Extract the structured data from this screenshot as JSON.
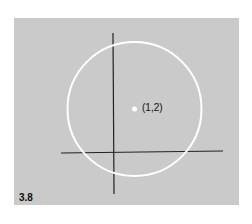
{
  "figure": {
    "label": "3.8",
    "background_color": "#cacaca",
    "circle_color": "#ffffff",
    "axis_color": "#222222"
  },
  "diagram": {
    "center_point": {
      "label": "(1,2)",
      "x": 1,
      "y": 2
    },
    "shape": "circle",
    "axes": [
      "x-axis",
      "y-axis"
    ]
  }
}
